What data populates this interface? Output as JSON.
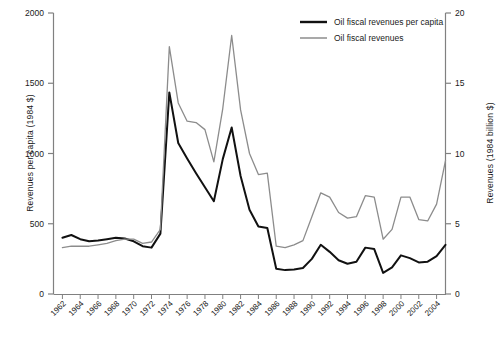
{
  "chart_data": {
    "type": "line",
    "title": "",
    "xlabel": "",
    "ylabel": "Revenues per capita (1984 $)",
    "ylabel_right": "Revenues (1984 billion $)",
    "xlim": [
      1961,
      2005
    ],
    "ylim": [
      0,
      2000
    ],
    "ylim_right": [
      0,
      20
    ],
    "grid": false,
    "legend_position": "top-right",
    "yticks": [
      "0",
      "500",
      "1000",
      "1500",
      "2000"
    ],
    "ytick_values": [
      0,
      500,
      1000,
      1500,
      2000
    ],
    "yticks_right": [
      "0",
      "5",
      "10",
      "15",
      "20"
    ],
    "ytick_values_right": [
      0,
      5,
      10,
      15,
      20
    ],
    "xticks": [
      "1962",
      "1964",
      "1966",
      "1968",
      "1970",
      "1972",
      "1974",
      "1976",
      "1978",
      "1980",
      "1982",
      "1984",
      "1986",
      "1988",
      "1990",
      "1992",
      "1994",
      "1996",
      "1998",
      "2000",
      "2002",
      "2004"
    ],
    "xtick_values": [
      1962,
      1964,
      1966,
      1968,
      1970,
      1972,
      1974,
      1976,
      1978,
      1980,
      1982,
      1984,
      1986,
      1988,
      1990,
      1992,
      1994,
      1996,
      1998,
      2000,
      2002,
      2004
    ],
    "x": [
      1962,
      1963,
      1964,
      1965,
      1966,
      1967,
      1968,
      1969,
      1970,
      1971,
      1972,
      1973,
      1974,
      1975,
      1976,
      1977,
      1978,
      1979,
      1980,
      1981,
      1982,
      1983,
      1984,
      1985,
      1986,
      1987,
      1988,
      1989,
      1990,
      1991,
      1992,
      1993,
      1994,
      1995,
      1996,
      1997,
      1998,
      1999,
      2000,
      2001,
      2002,
      2003,
      2004,
      2005
    ],
    "series": [
      {
        "name": "Oil fiscal revenues per capita",
        "color": "#111111",
        "axis": "left",
        "units": "1984 $ per capita",
        "values": [
          400,
          420,
          390,
          375,
          380,
          390,
          400,
          395,
          375,
          340,
          330,
          430,
          1435,
          1075,
          965,
          860,
          760,
          660,
          960,
          1185,
          840,
          600,
          480,
          470,
          180,
          170,
          175,
          185,
          250,
          350,
          300,
          240,
          215,
          230,
          330,
          320,
          150,
          190,
          275,
          255,
          225,
          230,
          270,
          350
        ]
      },
      {
        "name": "Oil fiscal revenues",
        "color": "#8c8c8c",
        "axis": "right",
        "units": "1984 billion $",
        "values": [
          3.3,
          3.4,
          3.4,
          3.4,
          3.5,
          3.6,
          3.8,
          3.9,
          3.9,
          3.6,
          3.7,
          4.6,
          17.6,
          13.6,
          12.3,
          12.2,
          11.7,
          9.4,
          13.2,
          18.4,
          13.1,
          10.0,
          8.5,
          8.6,
          3.4,
          3.3,
          3.5,
          3.8,
          5.5,
          7.2,
          6.9,
          5.8,
          5.4,
          5.5,
          7.0,
          6.9,
          3.9,
          4.6,
          6.9,
          6.9,
          5.3,
          5.2,
          6.4,
          9.5
        ]
      }
    ]
  },
  "legend": {
    "entries": [
      {
        "label": "Oil fiscal revenues per capita",
        "color": "#111111"
      },
      {
        "label": "Oil fiscal revenues",
        "color": "#8c8c8c"
      }
    ]
  },
  "axes": {
    "left_title": "Revenues per capita (1984 $)",
    "right_title": "Revenues (1984 billion $)"
  }
}
